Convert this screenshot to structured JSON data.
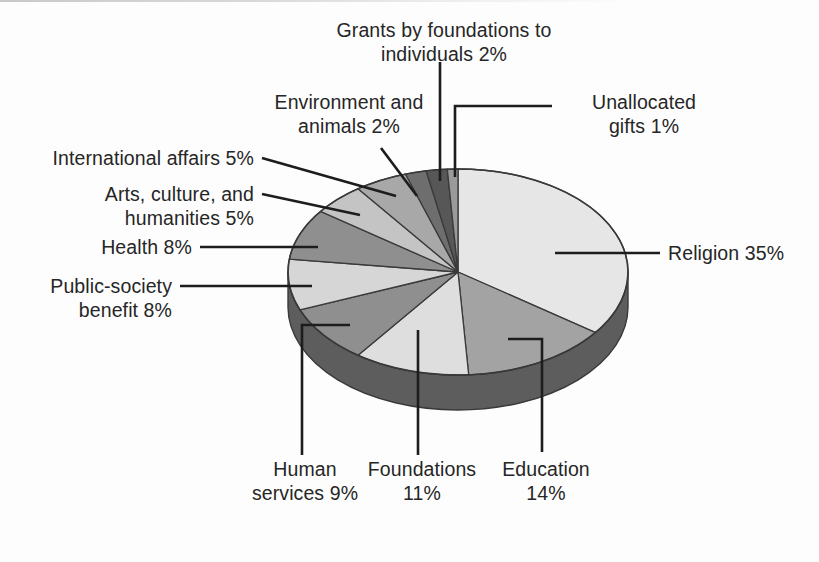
{
  "chart_data": {
    "type": "pie",
    "title": "",
    "subtitle": "",
    "xlabel": "",
    "ylabel": "",
    "legend_position": "callout-labels",
    "grid": false,
    "units": "percent",
    "three_d": true,
    "start_angle_deg": 0,
    "direction": "clockwise",
    "categories": [
      "Religion",
      "Education",
      "Foundations",
      "Human services",
      "Public-society benefit",
      "Health",
      "Arts, culture, and humanities",
      "International affairs",
      "Environment and animals",
      "Grants by foundations to individuals",
      "Unallocated gifts"
    ],
    "values": [
      35,
      14,
      11,
      9,
      8,
      8,
      5,
      5,
      2,
      2,
      1
    ],
    "slice_colors": [
      "#e6e6e6",
      "#a3a3a3",
      "#dedede",
      "#8f8f8f",
      "#d6d6d6",
      "#8f8f8f",
      "#c4c4c4",
      "#a8a8a8",
      "#6e6e6e",
      "#575757",
      "#9a9a9a"
    ],
    "side_color": "#5d5d5d",
    "outline_color": "#3a3a3a",
    "background_color": "#fdfdfd",
    "text_color": "#262626"
  },
  "labels": {
    "grants_individuals": "Grants by foundations to\nindividuals 2%",
    "environment_animals": "Environment and\nanimals 2%",
    "unallocated_gifts": "Unallocated\ngifts 1%",
    "international_affairs": "International affairs 5%",
    "arts_culture": "Arts, culture, and\nhumanities 5%",
    "health": "Health 8%",
    "public_society": "Public-society\nbenefit 8%",
    "religion": "Religion 35%",
    "human_services": "Human\nservices 9%",
    "foundations": "Foundations\n11%",
    "education": "Education\n14%"
  }
}
